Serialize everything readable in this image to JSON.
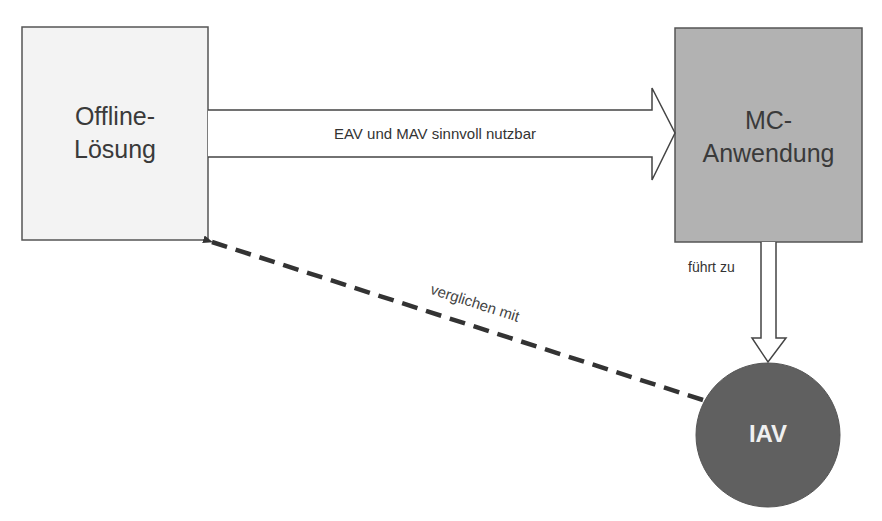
{
  "nodes": {
    "offline": {
      "label_line1": "Offline-",
      "label_line2": "Lösung",
      "fill": "#f3f3f3",
      "stroke": "#555555"
    },
    "mc": {
      "label_line1": "MC-",
      "label_line2": "Anwendung",
      "fill": "#b2b2b2",
      "stroke": "#555555"
    },
    "iav": {
      "label": "IAV",
      "fill": "#606060",
      "text_color": "#f0f0f0"
    }
  },
  "edges": {
    "offline_to_mc": {
      "label": "EAV und MAV sinnvoll nutzbar",
      "style": "hollow-block-arrow"
    },
    "mc_to_iav": {
      "label": "führt zu",
      "style": "hollow-block-arrow"
    },
    "iav_to_offline": {
      "label": "verglichen mit",
      "style": "dashed-arrow"
    }
  }
}
